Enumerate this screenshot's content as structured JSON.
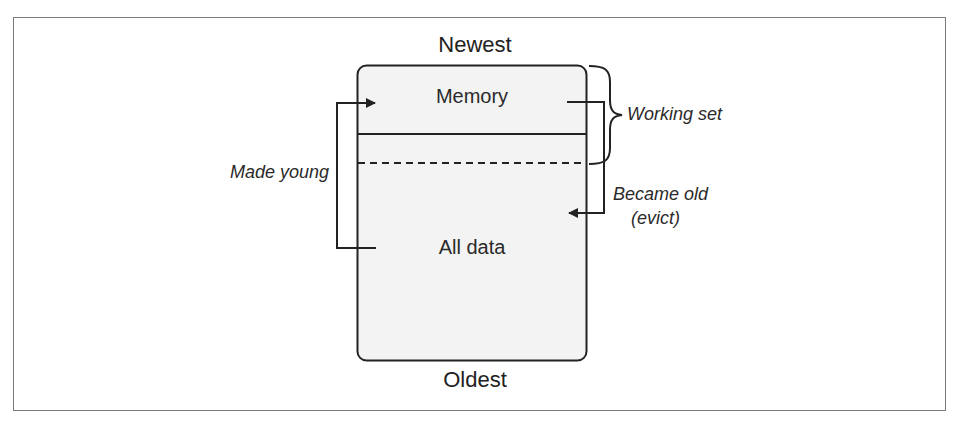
{
  "diagram": {
    "top_label": "Newest",
    "bottom_label": "Oldest",
    "regions": [
      {
        "label": "Memory"
      },
      {
        "label": "All data"
      }
    ],
    "annotations": {
      "working_set": "Working set",
      "made_young": "Made young",
      "became_old_line1": "Became old",
      "became_old_line2": "(evict)"
    },
    "colors": {
      "box_fill": "#f3f3f3",
      "stroke": "#222222",
      "frame": "#7a7a7a"
    }
  }
}
